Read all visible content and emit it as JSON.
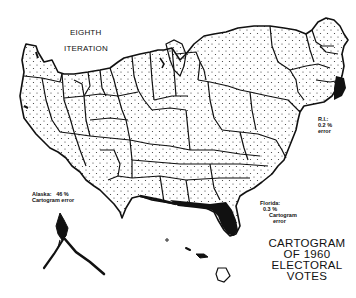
{
  "figure": {
    "heading": {
      "line1": "EIGHTH",
      "line2": "ITERATION"
    },
    "title": {
      "line1": "CARTOGRAM",
      "line2": "OF 1960",
      "line3": "ELECTORAL",
      "line4": "VOTES"
    },
    "annotations": {
      "rhode_island": {
        "line1": "R.I.:",
        "line2": "0.2 %",
        "line3": "error"
      },
      "alaska": {
        "line1": "Alaska:   46 %",
        "line2": "Cartogram error"
      },
      "florida": {
        "line1": "Florida:",
        "line2": "0.3 %",
        "line3": "Cartogram",
        "line4": "error"
      }
    },
    "colors": {
      "ink": "#111111",
      "background": "#ffffff",
      "highlight_fill": "#111111"
    },
    "highlighted_states": [
      "Florida",
      "Rhode Island"
    ]
  }
}
